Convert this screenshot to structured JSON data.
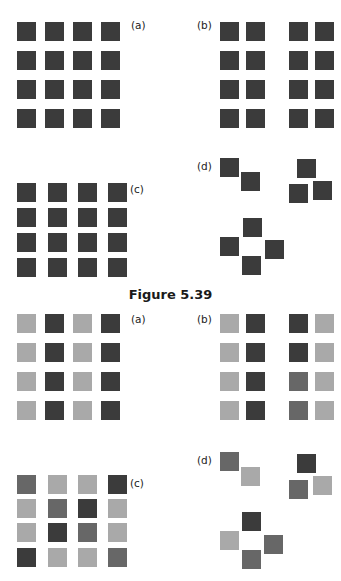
{
  "colors": {
    "dark": "#3b3b3b",
    "mid": "#676767",
    "light": "#a9a9a9"
  },
  "caption": "Figure 5.39",
  "panels_top": [
    {
      "label": "(a)",
      "label_pos": [
        131,
        20
      ],
      "squares": [
        [
          17,
          22,
          "dark"
        ],
        [
          45,
          22,
          "dark"
        ],
        [
          73,
          22,
          "dark"
        ],
        [
          101,
          22,
          "dark"
        ],
        [
          17,
          51,
          "dark"
        ],
        [
          45,
          51,
          "dark"
        ],
        [
          73,
          51,
          "dark"
        ],
        [
          101,
          51,
          "dark"
        ],
        [
          17,
          80,
          "dark"
        ],
        [
          45,
          80,
          "dark"
        ],
        [
          73,
          80,
          "dark"
        ],
        [
          101,
          80,
          "dark"
        ],
        [
          17,
          109,
          "dark"
        ],
        [
          45,
          109,
          "dark"
        ],
        [
          73,
          109,
          "dark"
        ],
        [
          101,
          109,
          "dark"
        ]
      ]
    },
    {
      "label": "(b)",
      "label_pos": [
        197,
        20
      ],
      "squares": [
        [
          220,
          22,
          "dark"
        ],
        [
          246,
          22,
          "dark"
        ],
        [
          289,
          22,
          "dark"
        ],
        [
          315,
          22,
          "dark"
        ],
        [
          220,
          51,
          "dark"
        ],
        [
          246,
          51,
          "dark"
        ],
        [
          289,
          51,
          "dark"
        ],
        [
          315,
          51,
          "dark"
        ],
        [
          220,
          80,
          "dark"
        ],
        [
          246,
          80,
          "dark"
        ],
        [
          289,
          80,
          "dark"
        ],
        [
          315,
          80,
          "dark"
        ],
        [
          220,
          109,
          "dark"
        ],
        [
          246,
          109,
          "dark"
        ],
        [
          289,
          109,
          "dark"
        ],
        [
          315,
          109,
          "dark"
        ]
      ]
    },
    {
      "label": "(c)",
      "label_pos": [
        130,
        184
      ],
      "squares": [
        [
          17,
          183,
          "dark"
        ],
        [
          48,
          183,
          "dark"
        ],
        [
          78,
          183,
          "dark"
        ],
        [
          108,
          183,
          "dark"
        ],
        [
          17,
          208,
          "dark"
        ],
        [
          48,
          208,
          "dark"
        ],
        [
          78,
          208,
          "dark"
        ],
        [
          108,
          208,
          "dark"
        ],
        [
          17,
          233,
          "dark"
        ],
        [
          48,
          233,
          "dark"
        ],
        [
          78,
          233,
          "dark"
        ],
        [
          108,
          233,
          "dark"
        ],
        [
          17,
          258,
          "dark"
        ],
        [
          48,
          258,
          "dark"
        ],
        [
          78,
          258,
          "dark"
        ],
        [
          108,
          258,
          "dark"
        ]
      ]
    },
    {
      "label": "(d)",
      "label_pos": [
        197,
        161
      ],
      "squares": [
        [
          220,
          158,
          "dark"
        ],
        [
          241,
          172,
          "dark"
        ],
        [
          297,
          159,
          "dark"
        ],
        [
          289,
          184,
          "dark"
        ],
        [
          313,
          181,
          "dark"
        ],
        [
          243,
          218,
          "dark"
        ],
        [
          220,
          237,
          "dark"
        ],
        [
          265,
          240,
          "dark"
        ],
        [
          242,
          256,
          "dark"
        ]
      ]
    }
  ],
  "panels_bottom": [
    {
      "label": "(a)",
      "label_pos": [
        131,
        314
      ],
      "squares": [
        [
          17,
          314,
          "light"
        ],
        [
          45,
          314,
          "dark"
        ],
        [
          73,
          314,
          "light"
        ],
        [
          101,
          314,
          "dark"
        ],
        [
          17,
          343,
          "light"
        ],
        [
          45,
          343,
          "dark"
        ],
        [
          73,
          343,
          "light"
        ],
        [
          101,
          343,
          "dark"
        ],
        [
          17,
          372,
          "light"
        ],
        [
          45,
          372,
          "dark"
        ],
        [
          73,
          372,
          "light"
        ],
        [
          101,
          372,
          "dark"
        ],
        [
          17,
          401,
          "light"
        ],
        [
          45,
          401,
          "dark"
        ],
        [
          73,
          401,
          "light"
        ],
        [
          101,
          401,
          "dark"
        ]
      ]
    },
    {
      "label": "(b)",
      "label_pos": [
        197,
        314
      ],
      "squares": [
        [
          220,
          314,
          "light"
        ],
        [
          246,
          314,
          "dark"
        ],
        [
          289,
          314,
          "dark"
        ],
        [
          315,
          314,
          "light"
        ],
        [
          220,
          343,
          "light"
        ],
        [
          246,
          343,
          "dark"
        ],
        [
          289,
          343,
          "dark"
        ],
        [
          315,
          343,
          "light"
        ],
        [
          220,
          372,
          "light"
        ],
        [
          246,
          372,
          "dark"
        ],
        [
          289,
          372,
          "mid"
        ],
        [
          315,
          372,
          "light"
        ],
        [
          220,
          401,
          "light"
        ],
        [
          246,
          401,
          "dark"
        ],
        [
          289,
          401,
          "mid"
        ],
        [
          315,
          401,
          "light"
        ]
      ]
    },
    {
      "label": "(c)",
      "label_pos": [
        130,
        478
      ],
      "squares": [
        [
          17,
          475,
          "mid"
        ],
        [
          48,
          475,
          "light"
        ],
        [
          78,
          475,
          "light"
        ],
        [
          108,
          475,
          "dark"
        ],
        [
          17,
          499,
          "light"
        ],
        [
          48,
          499,
          "mid"
        ],
        [
          78,
          499,
          "dark"
        ],
        [
          108,
          499,
          "light"
        ],
        [
          17,
          523,
          "light"
        ],
        [
          48,
          523,
          "dark"
        ],
        [
          78,
          523,
          "mid"
        ],
        [
          108,
          523,
          "light"
        ],
        [
          17,
          548,
          "dark"
        ],
        [
          48,
          548,
          "light"
        ],
        [
          78,
          548,
          "light"
        ],
        [
          108,
          548,
          "mid"
        ]
      ]
    },
    {
      "label": "(d)",
      "label_pos": [
        197,
        455
      ],
      "squares": [
        [
          220,
          452,
          "mid"
        ],
        [
          241,
          467,
          "light"
        ],
        [
          297,
          454,
          "dark"
        ],
        [
          289,
          480,
          "mid"
        ],
        [
          313,
          476,
          "light"
        ],
        [
          242,
          512,
          "dark"
        ],
        [
          220,
          531,
          "light"
        ],
        [
          264,
          535,
          "mid"
        ],
        [
          242,
          550,
          "mid"
        ]
      ]
    }
  ]
}
